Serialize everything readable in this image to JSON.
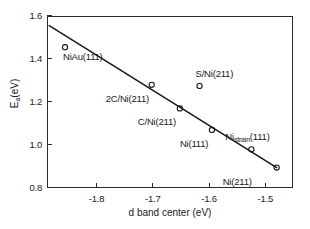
{
  "chart_data": {
    "type": "scatter",
    "title": "",
    "xlabel": "d band center (eV)",
    "ylabel": "Ea(eV)",
    "ylabel_base": "E",
    "ylabel_sub": "a",
    "ylabel_unit": "(eV)",
    "xlim": [
      -1.888,
      -1.451
    ],
    "ylim": [
      0.8,
      1.6
    ],
    "xticks": [
      "-1.8",
      "-1.7",
      "-1.6",
      "-1.5"
    ],
    "xtick_values": [
      -1.8,
      -1.7,
      -1.6,
      -1.5
    ],
    "yticks": [
      "1.6",
      "1.4",
      "1.2",
      "1.0",
      "0.8"
    ],
    "ytick_values": [
      1.6,
      1.4,
      1.2,
      1.0,
      0.8
    ],
    "grid": false,
    "legend": "none",
    "marker": "open-circle",
    "points": [
      {
        "label": "NiAu(111)",
        "x": -1.856,
        "y": 1.455,
        "label_dx": -2,
        "label_dy": 10
      },
      {
        "label": "2C/Ni(211)",
        "x": -1.702,
        "y": 1.28,
        "label_dx": -46,
        "label_dy": 14
      },
      {
        "label": "C/Ni(211)",
        "x": -1.652,
        "y": 1.17,
        "label_dx": -42,
        "label_dy": 14
      },
      {
        "label": "S/Ni(211)",
        "x": -1.617,
        "y": 1.275,
        "label_dx": -4,
        "label_dy": -12
      },
      {
        "label": "Ni(111)",
        "x": -1.595,
        "y": 1.07,
        "label_dx": -32,
        "label_dy": 14
      },
      {
        "label": "Nistrain(111)",
        "x": -1.525,
        "y": 0.98,
        "label_dx": -26,
        "label_dy": -12,
        "label_base": "Ni",
        "label_sub": "strain",
        "label_tail": "(111)"
      },
      {
        "label": "Ni(211)",
        "x": -1.48,
        "y": 0.895,
        "label_dx": -54,
        "label_dy": 14
      }
    ],
    "fit_line": {
      "description": "linear trend line",
      "x_start": -1.884,
      "y_start": 1.555,
      "x_end": -1.48,
      "y_end": 0.895
    }
  }
}
